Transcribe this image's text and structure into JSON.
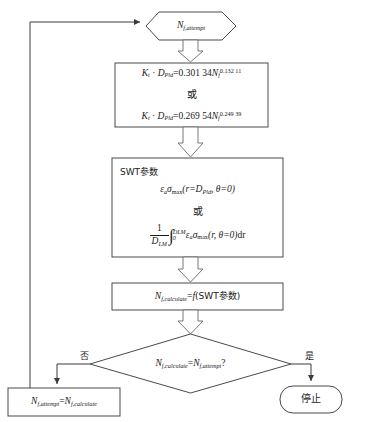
{
  "diagram": {
    "type": "flowchart",
    "stroke_color": "#4a4a4a",
    "text_color": "#1a1a1a",
    "background": "#ffffff"
  },
  "nodes": {
    "start_hexagon": {
      "shape": "hexagon",
      "symbol": "N",
      "subscript": "f,attempt",
      "text": "N f,attempt"
    },
    "equation_box": {
      "shape": "rectangle",
      "line1": {
        "lhs_k": "K",
        "lhs_k_sub": "t",
        "dot": "·",
        "lhs_d": "D",
        "lhs_d_sub": "Pld",
        "eq": "=",
        "coefficient": "0.301 34",
        "var": "N",
        "var_sub": "f",
        "exponent": "0.132 11"
      },
      "or_label": "或",
      "line2": {
        "lhs_k": "K",
        "lhs_k_sub": "t",
        "dot": "·",
        "lhs_d": "D",
        "lhs_d_sub": "Pld",
        "eq": "=",
        "coefficient": "0.269 54",
        "var": "N",
        "var_sub": "f",
        "exponent": "0.249 39"
      }
    },
    "swt_box": {
      "shape": "rectangle",
      "heading": "SWT参数",
      "line1": {
        "strain": "ε",
        "strain_sub": "a",
        "stress": "σ",
        "stress_sub": "max",
        "args": "(r=D",
        "args_sub": "Pld",
        "args_tail": ", θ=0)"
      },
      "or_label": "或",
      "line2": {
        "frac_num": "1",
        "frac_den": "D",
        "frac_den_sub": "LM",
        "integral": "∫",
        "upper_limit": "D",
        "upper_limit_sub": "LM",
        "lower_limit": "0",
        "strain": "ε",
        "strain_sub": "a",
        "stress": "σ",
        "stress_sub": "max",
        "args": "(r, θ=0)",
        "differential": "dr"
      }
    },
    "calc_box": {
      "shape": "rectangle",
      "symbol": "N",
      "subscript": "f,calculate",
      "eq": "=",
      "function": "f",
      "argument": "(SWT参数)"
    },
    "decision": {
      "shape": "diamond",
      "lhs": "N",
      "lhs_sub": "f,calculate",
      "eq": "=",
      "rhs": "N",
      "rhs_sub": "f,attempt",
      "question": "?"
    },
    "update_box": {
      "shape": "rectangle",
      "lhs": "N",
      "lhs_sub": "f,attempt",
      "eq": "=",
      "rhs": "N",
      "rhs_sub": "f,calculate"
    },
    "stop_terminal": {
      "shape": "rounded-rectangle",
      "text": "停止"
    }
  },
  "edge_labels": {
    "no": "否",
    "yes": "是"
  }
}
